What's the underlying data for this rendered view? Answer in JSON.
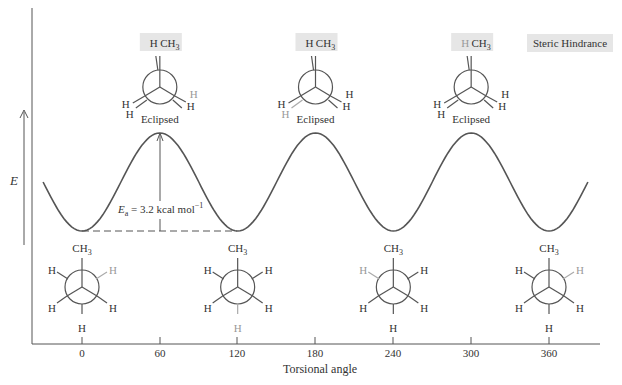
{
  "chart_data": {
    "type": "line",
    "title": "",
    "xlabel": "Torsional angle",
    "ylabel": "E",
    "x_ticks": [
      0,
      60,
      120,
      180,
      240,
      300,
      360
    ],
    "x_tick_labels": [
      "0",
      "60",
      "120",
      "180",
      "240",
      "300",
      "360"
    ],
    "xlim": [
      -40,
      400
    ],
    "grid": false,
    "series": [
      {
        "name": "Energy",
        "x": [
          0,
          60,
          120,
          180,
          240,
          300,
          360
        ],
        "values": [
          0,
          3.2,
          0,
          3.2,
          0,
          3.2,
          0
        ]
      }
    ],
    "annotations": {
      "barrier_label_main": "E",
      "barrier_label_sub": "a",
      "barrier_label_rest": " = 3.2 kcal mol",
      "barrier_label_sup": "−1",
      "eclipsed": [
        "Eclipsed",
        "Eclipsed",
        "Eclipsed"
      ],
      "steric_hindrance": "Steric Hindrance"
    },
    "eclipsed_newman": [
      {
        "angle": 60,
        "top_left": "H",
        "top_right": "CH",
        "top_right_sub": "3",
        "left_a": "H",
        "left_b": "H",
        "right_a": "H",
        "right_b": "H"
      },
      {
        "angle": 180,
        "top_left": "H",
        "top_right": "CH",
        "top_right_sub": "3",
        "left_a": "H",
        "left_b": "H",
        "right_a": "H",
        "right_b": "H"
      },
      {
        "angle": 300,
        "top_left": "H",
        "top_right": "CH",
        "top_right_sub": "3",
        "left_a": "H",
        "left_b": "H",
        "right_a": "H",
        "right_b": "H"
      }
    ],
    "staggered_newman": [
      {
        "angle": 0,
        "top": "CH",
        "top_sub": "3",
        "ul": "H",
        "ur": "H",
        "ll": "H",
        "lr": "H",
        "bottom": "H"
      },
      {
        "angle": 120,
        "top": "CH",
        "top_sub": "3",
        "ul": "H",
        "ur": "H",
        "ll": "H",
        "lr": "H",
        "bottom": "H"
      },
      {
        "angle": 240,
        "top": "CH",
        "top_sub": "3",
        "ul": "H",
        "ur": "H",
        "ll": "H",
        "lr": "H",
        "bottom": "H"
      },
      {
        "angle": 360,
        "top": "CH",
        "top_sub": "3",
        "ul": "H",
        "ur": "H",
        "ll": "H",
        "lr": "H",
        "bottom": "H"
      }
    ]
  }
}
